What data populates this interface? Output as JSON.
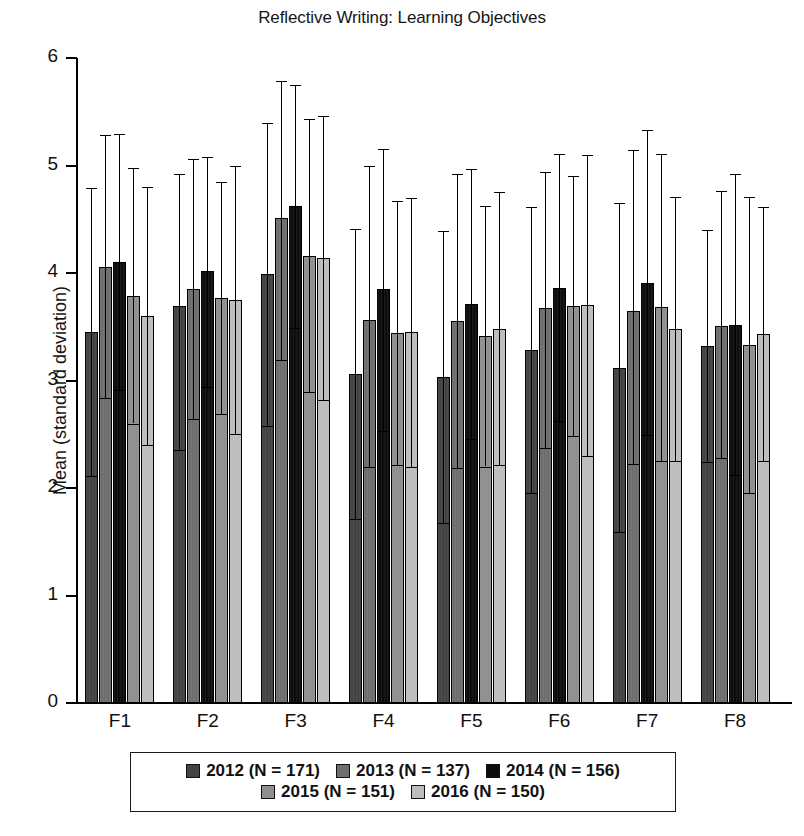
{
  "chart_data": {
    "type": "bar",
    "title": "Reflective Writing: Learning Objectives",
    "xlabel": "",
    "ylabel": "Mean (standard deviation)",
    "ylim": [
      0,
      6
    ],
    "ytick_values": [
      6,
      5,
      4,
      3,
      2,
      1,
      0
    ],
    "ytick_labels": [
      "6",
      "5",
      "4",
      "3",
      "2",
      "1",
      "0"
    ],
    "grid": false,
    "legend_position": "bottom",
    "error_bars": "standard deviation",
    "categories": [
      "F1",
      "F2",
      "F3",
      "F4",
      "F5",
      "F6",
      "F7",
      "F8"
    ],
    "series": [
      {
        "name": "2012 (N = 171)",
        "color": "#434343",
        "values": [
          3.45,
          3.69,
          3.99,
          3.06,
          3.03,
          3.28,
          3.12,
          3.32
        ],
        "err_upper": [
          4.79,
          4.92,
          5.4,
          4.41,
          4.39,
          4.61,
          4.65,
          4.4
        ],
        "err_lower": [
          2.11,
          2.35,
          2.58,
          1.71,
          1.67,
          1.95,
          1.59,
          2.24
        ]
      },
      {
        "name": "2013 (N = 137)",
        "color": "#6e6e6e",
        "values": [
          4.06,
          3.85,
          4.51,
          3.56,
          3.55,
          3.67,
          3.65,
          3.51
        ],
        "err_upper": [
          5.28,
          5.06,
          5.79,
          5.0,
          4.92,
          4.94,
          5.14,
          4.76
        ],
        "err_lower": [
          2.84,
          2.64,
          3.19,
          2.2,
          2.19,
          2.37,
          2.22,
          2.28
        ]
      },
      {
        "name": "2014 (N = 156)",
        "color": "#0d0d0d",
        "values": [
          4.1,
          4.02,
          4.62,
          3.85,
          3.71,
          3.86,
          3.91,
          3.52
        ],
        "err_upper": [
          5.29,
          5.08,
          5.75,
          5.15,
          4.97,
          5.11,
          5.33,
          4.92
        ],
        "err_lower": [
          2.91,
          2.94,
          3.49,
          2.53,
          2.46,
          2.62,
          2.49,
          2.12
        ]
      },
      {
        "name": "2015 (N = 151)",
        "color": "#8f8f8f",
        "values": [
          3.79,
          3.77,
          4.16,
          3.44,
          3.41,
          3.69,
          3.68,
          3.33
        ],
        "err_upper": [
          4.98,
          4.85,
          5.43,
          4.67,
          4.62,
          4.9,
          5.11,
          4.71
        ],
        "err_lower": [
          2.6,
          2.69,
          2.89,
          2.21,
          2.2,
          2.48,
          2.25,
          1.95
        ]
      },
      {
        "name": "2016 (N = 150)",
        "color": "#bdbdbd",
        "values": [
          3.6,
          3.75,
          4.14,
          3.45,
          3.48,
          3.7,
          3.48,
          3.43
        ],
        "err_upper": [
          4.8,
          5.0,
          5.46,
          4.7,
          4.75,
          5.1,
          4.71,
          4.61
        ],
        "err_lower": [
          2.4,
          2.5,
          2.82,
          2.2,
          2.21,
          2.3,
          2.25,
          2.25
        ]
      }
    ]
  },
  "legend": {
    "rows": [
      [
        "2012 (N = 171)",
        "2013 (N = 137)",
        "2014 (N = 156)"
      ],
      [
        "2015 (N = 151)",
        "2016 (N = 150)"
      ]
    ]
  }
}
